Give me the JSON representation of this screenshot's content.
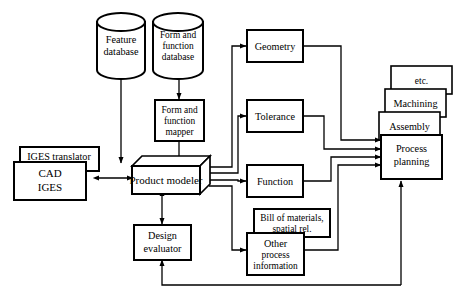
{
  "diagram": {
    "stroke_color": "#000000",
    "background_color": "#ffffff",
    "nodes": {
      "feature_database": {
        "line1": "Feature",
        "line2": "database",
        "shape": "cylinder"
      },
      "form_function_database": {
        "line1": "Form and",
        "line2": "function",
        "line3": "database",
        "shape": "cylinder"
      },
      "form_function_mapper": {
        "line1": "Form and",
        "line2": "function",
        "line3": "mapper",
        "shape": "rect"
      },
      "iges_translator": {
        "line1": "IGES translator",
        "shape": "rect"
      },
      "cad_iges": {
        "line1": "CAD",
        "line2": "IGES",
        "shape": "rect"
      },
      "product_modeler": {
        "line1": "Product modeler",
        "shape": "iso-box"
      },
      "design_evaluator": {
        "line1": "Design",
        "line2": "evaluator",
        "shape": "rect"
      },
      "geometry": {
        "line1": "Geometry",
        "shape": "rect"
      },
      "tolerance": {
        "line1": "Tolerance",
        "shape": "rect"
      },
      "function": {
        "line1": "Function",
        "shape": "rect"
      },
      "bill_of_materials": {
        "line1": "Bill of materials,",
        "line2": "spatial rel.",
        "shape": "rect"
      },
      "other_process_information": {
        "line1": "Other",
        "line2": "process",
        "line3": "information",
        "shape": "rect"
      },
      "etc": {
        "line1": "etc.",
        "shape": "rect"
      },
      "machining": {
        "line1": "Machining",
        "shape": "rect"
      },
      "assembly": {
        "line1": "Assembly",
        "shape": "rect"
      },
      "process_planning": {
        "line1": "Process",
        "line2": "planning",
        "shape": "rect"
      }
    }
  }
}
